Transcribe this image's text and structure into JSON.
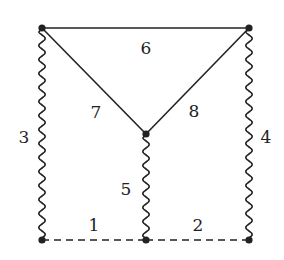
{
  "diagram": {
    "nodes": [
      {
        "id": "top-left",
        "x": 42,
        "y": 28
      },
      {
        "id": "top-right",
        "x": 249,
        "y": 28
      },
      {
        "id": "center",
        "x": 146,
        "y": 134
      },
      {
        "id": "bottom-left",
        "x": 42,
        "y": 240
      },
      {
        "id": "bottom-middle",
        "x": 146,
        "y": 240
      },
      {
        "id": "bottom-right",
        "x": 249,
        "y": 240
      }
    ],
    "edges": [
      {
        "label": "1",
        "from": "bottom-left",
        "to": "bottom-middle",
        "style": "dashed",
        "label_x": 94,
        "label_y": 231
      },
      {
        "label": "2",
        "from": "bottom-middle",
        "to": "bottom-right",
        "style": "dashed",
        "label_x": 198,
        "label_y": 231
      },
      {
        "label": "3",
        "from": "top-left",
        "to": "bottom-left",
        "style": "wavy",
        "label_x": 24,
        "label_y": 143
      },
      {
        "label": "4",
        "from": "top-right",
        "to": "bottom-right",
        "style": "wavy",
        "label_x": 266,
        "label_y": 143
      },
      {
        "label": "5",
        "from": "center",
        "to": "bottom-middle",
        "style": "wavy",
        "label_x": 126,
        "label_y": 195
      },
      {
        "label": "6",
        "from": "top-left",
        "to": "top-right",
        "style": "solid",
        "label_x": 146,
        "label_y": 54
      },
      {
        "label": "7",
        "from": "top-left",
        "to": "center",
        "style": "solid",
        "label_x": 96,
        "label_y": 118
      },
      {
        "label": "8",
        "from": "top-right",
        "to": "center",
        "style": "solid",
        "label_x": 194,
        "label_y": 117
      }
    ],
    "colors": {
      "stroke": "#222222",
      "background": "#ffffff"
    }
  }
}
